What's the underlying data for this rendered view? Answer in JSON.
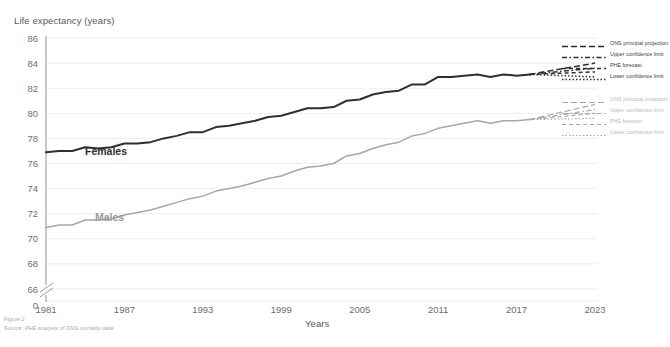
{
  "figure": {
    "caption": "Figure 2",
    "source": "Source: PHE analysis of ONS mortality data"
  },
  "axes": {
    "y_title": "Life expectancy (years)",
    "x_title": "Years",
    "y_ticks": [
      "86",
      "84",
      "82",
      "80",
      "78",
      "76",
      "74",
      "72",
      "70",
      "68",
      "66",
      "0"
    ],
    "x_ticks": [
      "1981",
      "1987",
      "1993",
      "1999",
      "2005",
      "2011",
      "2017",
      "2023"
    ]
  },
  "series_labels": {
    "females": "Females",
    "males": "Males"
  },
  "legend": {
    "females": [
      {
        "label": "ONS principal projection",
        "style": "dashed-long"
      },
      {
        "label": "Upper confidence limit",
        "style": "dash-dot"
      },
      {
        "label": "PHE forecast",
        "style": "dashed-med"
      },
      {
        "label": "Lower confidence limit",
        "style": "dotted"
      }
    ],
    "males": [
      {
        "label": "ONS principal projection",
        "style": "dashed-long"
      },
      {
        "label": "Upper confidence limit",
        "style": "dash-dot"
      },
      {
        "label": "PHE forecast",
        "style": "dashed-med"
      },
      {
        "label": "Lower confidence limit",
        "style": "dotted"
      }
    ]
  },
  "colors": {
    "females": "#2f2f2f",
    "males": "#a6a6a8",
    "grid": "#ededee",
    "axis": "#9c9c9e",
    "text": "#6d6e70"
  },
  "chart_data": {
    "type": "line",
    "title": "",
    "xlabel": "Years",
    "ylabel": "Life expectancy (years)",
    "xlim": [
      1981,
      2023
    ],
    "ylim": [
      65,
      86
    ],
    "y_axis_break": true,
    "y_break_between": [
      0,
      66
    ],
    "grid": "horizontal",
    "legend_position": "right",
    "x": [
      1981,
      1982,
      1983,
      1984,
      1985,
      1986,
      1987,
      1988,
      1989,
      1990,
      1991,
      1992,
      1993,
      1994,
      1995,
      1996,
      1997,
      1998,
      1999,
      2000,
      2001,
      2002,
      2003,
      2004,
      2005,
      2006,
      2007,
      2008,
      2009,
      2010,
      2011,
      2012,
      2013,
      2014,
      2015,
      2016,
      2017,
      2018
    ],
    "series": [
      {
        "name": "Females",
        "color": "#2f2f2f",
        "values": [
          76.9,
          77.0,
          77.0,
          77.3,
          77.2,
          77.3,
          77.6,
          77.6,
          77.7,
          78.0,
          78.2,
          78.5,
          78.5,
          78.9,
          79.0,
          79.2,
          79.4,
          79.7,
          79.8,
          80.1,
          80.4,
          80.4,
          80.5,
          81.0,
          81.1,
          81.5,
          81.7,
          81.8,
          82.3,
          82.3,
          82.9,
          82.9,
          83.0,
          83.1,
          82.9,
          83.1,
          83.0,
          83.1
        ],
        "style": "solid"
      },
      {
        "name": "Males",
        "color": "#a6a6a8",
        "values": [
          70.9,
          71.1,
          71.1,
          71.5,
          71.5,
          71.6,
          71.9,
          72.1,
          72.3,
          72.6,
          72.9,
          73.2,
          73.4,
          73.8,
          74.0,
          74.2,
          74.5,
          74.8,
          75.0,
          75.4,
          75.7,
          75.8,
          76.0,
          76.6,
          76.8,
          77.2,
          77.5,
          77.7,
          78.2,
          78.4,
          78.8,
          79.0,
          79.2,
          79.4,
          79.2,
          79.4,
          79.4,
          79.5
        ],
        "style": "solid"
      }
    ],
    "projections": {
      "x_start": 2018,
      "x_end": 2023,
      "females": [
        {
          "name": "ONS principal projection",
          "start": 83.1,
          "end": 84.0,
          "style": "dashed-long"
        },
        {
          "name": "Upper confidence limit",
          "start": 83.1,
          "end": 83.6,
          "style": "dash-dot"
        },
        {
          "name": "PHE forecast",
          "start": 83.1,
          "end": 83.3,
          "style": "dashed-med"
        },
        {
          "name": "Lower confidence limit",
          "start": 83.1,
          "end": 82.9,
          "style": "dotted"
        }
      ],
      "males": [
        {
          "name": "ONS principal projection",
          "start": 79.5,
          "end": 80.7,
          "style": "dashed-long"
        },
        {
          "name": "Upper confidence limit",
          "start": 79.5,
          "end": 80.3,
          "style": "dash-dot"
        },
        {
          "name": "PHE forecast",
          "start": 79.5,
          "end": 80.0,
          "style": "dashed-med"
        },
        {
          "name": "Lower confidence limit",
          "start": 79.5,
          "end": 79.6,
          "style": "dotted"
        }
      ]
    }
  }
}
